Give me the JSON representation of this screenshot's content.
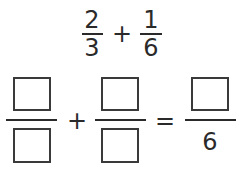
{
  "problem": {
    "first_fraction": {
      "numerator": "2",
      "denominator": "3"
    },
    "operator": "+",
    "second_fraction": {
      "numerator": "1",
      "denominator": "6"
    }
  },
  "answer_equation": {
    "term1": {
      "numerator": "",
      "denominator": ""
    },
    "operator": "+",
    "term2": {
      "numerator": "",
      "denominator": ""
    },
    "equals": "=",
    "result": {
      "numerator": "",
      "denominator": "6"
    }
  },
  "colors": {
    "ink": "#2a2a2a",
    "box_border": "#3a3a3a",
    "background": "#ffffff"
  }
}
